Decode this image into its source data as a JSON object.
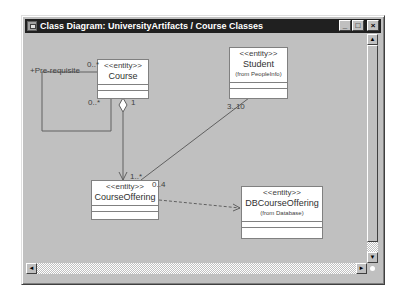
{
  "window": {
    "title": "Class Diagram: UniversityArtifacts / Course Classes",
    "buttons": {
      "minimize": "_",
      "maximize": "□",
      "close": "×"
    }
  },
  "classes": [
    {
      "id": "course",
      "stereotype": "<<entity>>",
      "name": "Course",
      "from": ""
    },
    {
      "id": "student",
      "stereotype": "<<entity>>",
      "name": "Student",
      "from": "(from PeopleInfo)"
    },
    {
      "id": "course_offering",
      "stereotype": "<<entity>>",
      "name": "CourseOffering",
      "from": ""
    },
    {
      "id": "db_course_offering",
      "stereotype": "<<entity>>",
      "name": "DBCourseOffering",
      "from": "(from Database)"
    }
  ],
  "labels": {
    "prereq_role": "+Pre-requisite",
    "prereq_mult_top": "0..*",
    "prereq_mult_bottom": "0..*",
    "course_agg_mult": "1",
    "offering_agg_mult": "1..*",
    "student_mult": "3..10",
    "offering_student_mult": "0..4"
  },
  "scrollbars": {
    "up_arrow": "▲",
    "down_arrow": "▼",
    "left_arrow": "◄",
    "right_arrow": "►"
  },
  "colors": {
    "titlebar": "#202020",
    "line": "#606060",
    "window_face": "#c0c0c0"
  }
}
